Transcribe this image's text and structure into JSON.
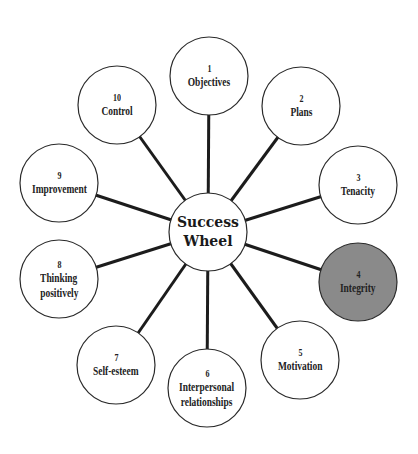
{
  "diagram": {
    "hub": {
      "line1": "Success",
      "line2": "Wheel",
      "cx": 208,
      "cy": 232,
      "r": 39
    },
    "colors": {
      "line": "#1c1c1c",
      "node_fill": "#ffffff",
      "highlight_fill": "#8a8a8a",
      "text": "#222222"
    },
    "nodes": [
      {
        "num": "1",
        "label": "Objectives",
        "label2": "",
        "cx": 209,
        "cy": 76,
        "highlight": false
      },
      {
        "num": "2",
        "label": "Plans",
        "label2": "",
        "cx": 301,
        "cy": 106,
        "highlight": false
      },
      {
        "num": "3",
        "label": "Tenacity",
        "label2": "",
        "cx": 358,
        "cy": 185,
        "highlight": false
      },
      {
        "num": "4",
        "label": "Integrity",
        "label2": "",
        "cx": 358,
        "cy": 282,
        "highlight": true
      },
      {
        "num": "5",
        "label": "Motivation",
        "label2": "",
        "cx": 300,
        "cy": 360,
        "highlight": false
      },
      {
        "num": "6",
        "label": "Interpersonal",
        "label2": "relationships",
        "cx": 207,
        "cy": 388,
        "highlight": false
      },
      {
        "num": "7",
        "label": "Self-esteem",
        "label2": "",
        "cx": 116,
        "cy": 365,
        "highlight": false
      },
      {
        "num": "8",
        "label": "Thinking",
        "label2": "positively",
        "cx": 59,
        "cy": 279,
        "highlight": false
      },
      {
        "num": "9",
        "label": "Improvement",
        "label2": "",
        "cx": 59,
        "cy": 183,
        "highlight": false
      },
      {
        "num": "10",
        "label": "Control",
        "label2": "",
        "cx": 117,
        "cy": 105,
        "highlight": false
      }
    ],
    "node_radius": 39
  }
}
